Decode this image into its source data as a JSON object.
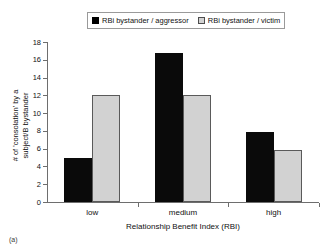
{
  "figure": {
    "tag": "(a)"
  },
  "legend": {
    "position": "top-center",
    "entries": [
      {
        "label": "RBi bystander / aggressor",
        "color": "#000000",
        "swatch": "filled-square-icon"
      },
      {
        "label": "RBi bystander / victim",
        "color": "#d2d2d2",
        "swatch": "outlined-square-icon"
      }
    ]
  },
  "chart_data": {
    "type": "bar",
    "title": "",
    "categories": [
      "low",
      "medium",
      "high"
    ],
    "series": [
      {
        "name": "RBi bystander / aggressor",
        "values": [
          5,
          16.8,
          7.9
        ],
        "color": "#000000"
      },
      {
        "name": "RBi bystander / victim",
        "values": [
          12,
          12,
          5.8
        ],
        "color": "#d2d2d2"
      }
    ],
    "xlabel": "Relationship Benefit Index (RBI)",
    "ylabel_line1": "# of 'consolation' by a",
    "ylabel_line2": "subject/B bystander",
    "ylim": [
      0,
      18
    ],
    "ytick_labels": [
      "0",
      "2",
      "4",
      "6",
      "8",
      "10",
      "12",
      "14",
      "16",
      "18"
    ],
    "ytick_values": [
      0,
      2,
      4,
      6,
      8,
      10,
      12,
      14,
      16,
      18
    ],
    "grid": false,
    "legend_position": "top"
  }
}
